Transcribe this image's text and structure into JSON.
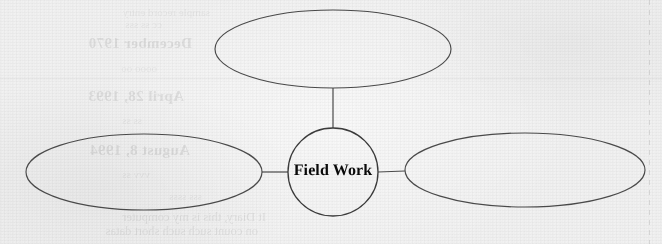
{
  "document": {
    "kind": "scanned-paper-concept-map",
    "background_color": "#f1f1f1",
    "ink_color": "#4a4a4a",
    "label_color": "#0a0a0a"
  },
  "diagram": {
    "type": "concept-map",
    "center_node": {
      "label": "Field Work",
      "shape": "ellipse",
      "cx": 333,
      "cy": 172,
      "rx": 45,
      "ry": 44,
      "empty": false
    },
    "branch_nodes": [
      {
        "id": "top",
        "label": "",
        "shape": "ellipse",
        "cx": 333,
        "cy": 49,
        "rx": 118,
        "ry": 39,
        "empty": true
      },
      {
        "id": "left",
        "label": "",
        "shape": "ellipse",
        "cx": 144,
        "cy": 172,
        "rx": 118,
        "ry": 38,
        "empty": true
      },
      {
        "id": "right",
        "label": "",
        "shape": "ellipse",
        "cx": 525,
        "cy": 170,
        "rx": 120,
        "ry": 37,
        "empty": true
      }
    ],
    "connectors": [
      {
        "id": "center-to-top",
        "from": "center",
        "to": "top",
        "x1": 333,
        "y1": 128,
        "x2": 333,
        "y2": 88
      },
      {
        "id": "center-to-left",
        "from": "center",
        "to": "left",
        "x1": 288,
        "y1": 172,
        "x2": 262,
        "y2": 172
      },
      {
        "id": "center-to-right",
        "from": "center",
        "to": "right",
        "x1": 378,
        "y1": 172,
        "x2": 405,
        "y2": 171
      }
    ]
  },
  "bleed_through": {
    "note": "faint mirrored show-through from the reverse side of the sheet",
    "lines": [
      {
        "id": "date-1",
        "text": "December 1970",
        "left": 470,
        "top": 35,
        "style": "bleed-date"
      },
      {
        "id": "date-2",
        "text": "April 28, 1993",
        "left": 478,
        "top": 88,
        "style": "bleed-date"
      },
      {
        "id": "date-3",
        "text": "August 8, 1994",
        "left": 472,
        "top": 142,
        "style": "bleed-date"
      },
      {
        "id": "body-1",
        "text": "It Diary, this is my computer",
        "left": 396,
        "top": 210,
        "style": "bleed-body"
      },
      {
        "id": "body-2",
        "text": "on  count such such short datas",
        "left": 404,
        "top": 224,
        "style": "bleed-body"
      },
      {
        "id": "faint-1",
        "text": "sample record entry",
        "left": 452,
        "top": 6,
        "style": "bleed-faint"
      },
      {
        "id": "faint-2",
        "text": "cc  ss   sss",
        "left": 500,
        "top": 18,
        "style": "bleed-faint"
      },
      {
        "id": "faint-3",
        "text": "oooo  oo",
        "left": 505,
        "top": 62,
        "style": "bleed-faint"
      },
      {
        "id": "faint-4",
        "text": "ss ss",
        "left": 520,
        "top": 114,
        "style": "bleed-faint"
      },
      {
        "id": "faint-5",
        "text": "vvv  ss",
        "left": 512,
        "top": 168,
        "style": "bleed-faint"
      },
      {
        "id": "faint-6",
        "text": "sss  ssss",
        "left": 460,
        "top": 190,
        "style": "bleed-faint"
      }
    ]
  }
}
